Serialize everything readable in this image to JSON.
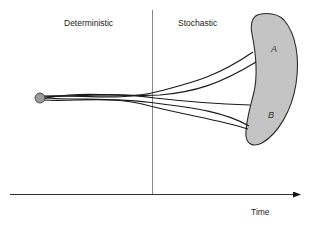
{
  "diagram": {
    "title": "",
    "regions": {
      "left_label": "Deterministic",
      "right_label": "Stochastic"
    },
    "axis": {
      "x_label": "Time"
    },
    "outcomes": {
      "a_label": "A",
      "b_label": "B"
    },
    "colors": {
      "line": "#1a1a1a",
      "divider": "#888888",
      "axis": "#333333",
      "region_fill": "#c4c4c4",
      "region_stroke": "#2a2a2a",
      "start_fill": "#9a9a9a"
    },
    "start_point": {
      "x": 40,
      "y": 98
    },
    "trajectories": [
      {
        "name": "path-to-A-upper",
        "end": "A"
      },
      {
        "name": "path-to-A-lower",
        "end": "A"
      },
      {
        "name": "path-to-B-upper",
        "end": "B"
      },
      {
        "name": "path-to-B-middle",
        "end": "B"
      },
      {
        "name": "path-to-B-lower",
        "end": "B"
      }
    ]
  }
}
